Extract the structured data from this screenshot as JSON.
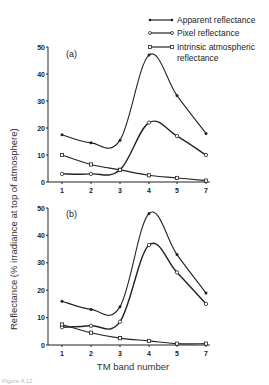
{
  "legend": {
    "items": [
      {
        "label": "Apparent reflectance",
        "marker": "filled-circle"
      },
      {
        "label": "Pixel reflectance",
        "marker": "open-circle"
      },
      {
        "label": "Intrinsic atmospheric",
        "label2": "reflectance",
        "marker": "open-square"
      }
    ]
  },
  "ylabel": "Reflectance (% irradiance at top of atmosphere)",
  "xlabel": "TM band number",
  "caption": "Figure 4.12",
  "chart_data": [
    {
      "type": "line",
      "title": "(a)",
      "xlabel": "TM band number",
      "ylabel": "Reflectance (% irradiance at top of atmosphere)",
      "categories": [
        "1",
        "2",
        "3",
        "4",
        "5",
        "7"
      ],
      "ylim": [
        0,
        50
      ],
      "yticks": [
        0,
        10,
        20,
        30,
        40,
        50
      ],
      "grid": false,
      "legend_position": "top-right",
      "series": [
        {
          "name": "Apparent reflectance",
          "values": [
            17.5,
            14.5,
            15.5,
            47,
            32,
            18
          ]
        },
        {
          "name": "Pixel reflectance",
          "values": [
            3,
            3,
            4.5,
            22,
            17,
            10
          ]
        },
        {
          "name": "Intrinsic atmospheric reflectance",
          "values": [
            10,
            6.5,
            4.5,
            2.5,
            1.5,
            0.5
          ]
        }
      ]
    },
    {
      "type": "line",
      "title": "(b)",
      "xlabel": "TM band number",
      "ylabel": "Reflectance (% irradiance at top of atmosphere)",
      "categories": [
        "1",
        "2",
        "3",
        "4",
        "5",
        "7"
      ],
      "ylim": [
        0,
        50
      ],
      "yticks": [
        0,
        10,
        20,
        30,
        40,
        50
      ],
      "grid": false,
      "series": [
        {
          "name": "Apparent reflectance",
          "values": [
            16,
            13,
            14,
            48,
            33,
            19
          ]
        },
        {
          "name": "Pixel reflectance",
          "values": [
            6.5,
            7,
            8.5,
            36.5,
            26.5,
            15
          ]
        },
        {
          "name": "Intrinsic atmospheric reflectance",
          "values": [
            7.5,
            4.5,
            2.5,
            1.5,
            0.5,
            0.5
          ]
        }
      ]
    }
  ]
}
